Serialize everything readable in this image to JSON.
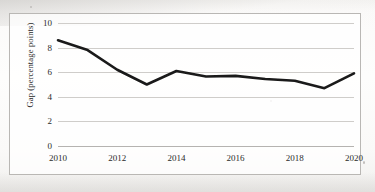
{
  "chart_data": {
    "type": "line",
    "title": "",
    "xlabel": "",
    "ylabel": "Gap (percentage points)",
    "x": [
      2010,
      2011,
      2012,
      2013,
      2014,
      2015,
      2016,
      2017,
      2018,
      2019,
      2020
    ],
    "values": [
      8.6,
      7.8,
      6.2,
      5.0,
      6.1,
      5.65,
      5.7,
      5.45,
      5.3,
      4.7,
      5.9
    ],
    "series": [
      {
        "name": "Gap",
        "values": [
          8.6,
          7.8,
          6.2,
          5.0,
          6.1,
          5.65,
          5.7,
          5.45,
          5.3,
          4.7,
          5.9
        ]
      }
    ],
    "xlim": [
      2010,
      2020
    ],
    "ylim": [
      0,
      10
    ],
    "y_ticks": [
      0,
      2,
      4,
      6,
      8,
      10
    ],
    "y_tick_labels": [
      "0",
      "2",
      "4",
      "6",
      "8",
      "10"
    ],
    "x_ticks": [
      2010,
      2012,
      2014,
      2016,
      2018,
      2020
    ],
    "x_tick_labels": [
      "2010",
      "2012",
      "2014",
      "2016",
      "2018",
      "2020"
    ],
    "grid": "horizontal",
    "legend": "none",
    "line_color": "#1a1a1a",
    "line_width": 2.6,
    "grid_color": "#cfcdca",
    "frame_color": "#b9b7b4",
    "background": "#ffffff"
  }
}
